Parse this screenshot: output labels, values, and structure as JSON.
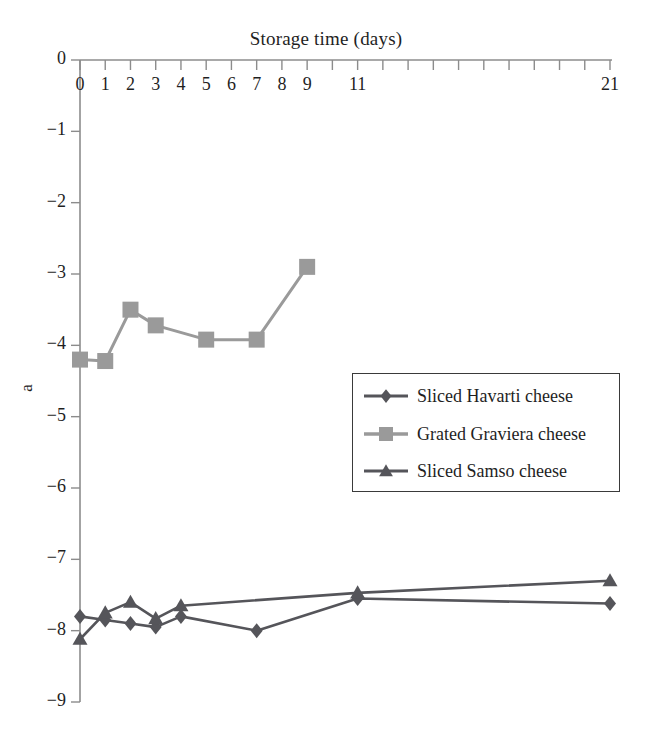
{
  "chart_data": {
    "type": "line",
    "title": "Storage time (days)",
    "xlabel": "Storage time (days)",
    "ylabel": "a",
    "xlim": [
      0,
      21
    ],
    "ylim": [
      -9,
      0
    ],
    "grid": false,
    "legend_position": "center-right",
    "x_tick_values": [
      0,
      1,
      2,
      3,
      4,
      5,
      6,
      7,
      8,
      9,
      11,
      21
    ],
    "x_tick_labels": [
      "0",
      "1",
      "2",
      "3",
      "4",
      "5",
      "6",
      "7",
      "8",
      "9",
      "11",
      "21"
    ],
    "x_minor_ticks": [
      0,
      1,
      2,
      3,
      4,
      5,
      6,
      7,
      8,
      9,
      10,
      11,
      12,
      13,
      14,
      15,
      16,
      17,
      18,
      19,
      20,
      21
    ],
    "y_tick_values": [
      0,
      -1,
      -2,
      -3,
      -4,
      -5,
      -6,
      -7,
      -8,
      -9
    ],
    "y_tick_labels": [
      "0",
      "−1",
      "−2",
      "−3",
      "−4",
      "−5",
      "−6",
      "−7",
      "−8",
      "−9"
    ],
    "series": [
      {
        "name": "Sliced Havarti cheese",
        "marker": "diamond",
        "color": "#55555a",
        "x": [
          0,
          1,
          2,
          3,
          4,
          7,
          11,
          21
        ],
        "values": [
          -7.8,
          -7.85,
          -7.9,
          -7.95,
          -7.8,
          -8.0,
          -7.55,
          -7.62
        ]
      },
      {
        "name": "Grated Graviera cheese",
        "marker": "square",
        "color": "#9a9a9a",
        "x": [
          0,
          1,
          2,
          3,
          5,
          7,
          9
        ],
        "values": [
          -4.2,
          -4.22,
          -3.5,
          -3.72,
          -3.92,
          -3.92,
          -2.9
        ]
      },
      {
        "name": "Sliced Samso cheese",
        "marker": "triangle",
        "color": "#55555a",
        "x": [
          0,
          1,
          2,
          3,
          4,
          11,
          21
        ],
        "values": [
          -8.12,
          -7.75,
          -7.6,
          -7.83,
          -7.65,
          -7.47,
          -7.3
        ]
      }
    ]
  },
  "legend": {
    "items": [
      {
        "label": "Sliced Havarti cheese",
        "marker": "diamond",
        "color": "#55555a"
      },
      {
        "label": "Grated Graviera cheese",
        "marker": "square",
        "color": "#9a9a9a"
      },
      {
        "label": "Sliced Samso cheese",
        "marker": "triangle",
        "color": "#55555a"
      }
    ]
  }
}
